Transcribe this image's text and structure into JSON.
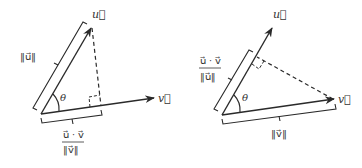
{
  "colors": {
    "stroke": "#2a2a2a",
    "text": "#333333",
    "background": "#ffffff"
  },
  "left_diagram": {
    "description": "Projection of u onto v",
    "vector_u_label": "u⃗",
    "vector_v_label": "v⃗",
    "angle_label": "θ",
    "norm_u_label": "‖u⃗‖",
    "projection_numerator": "u⃗ · v⃗",
    "projection_denominator": "‖v⃗‖"
  },
  "right_diagram": {
    "description": "Projection of v onto u",
    "vector_u_label": "u⃗",
    "vector_v_label": "v⃗",
    "angle_label": "θ",
    "norm_v_label": "‖v⃗‖",
    "projection_numerator": "u⃗ · v⃗",
    "projection_denominator": "‖u⃗‖"
  }
}
